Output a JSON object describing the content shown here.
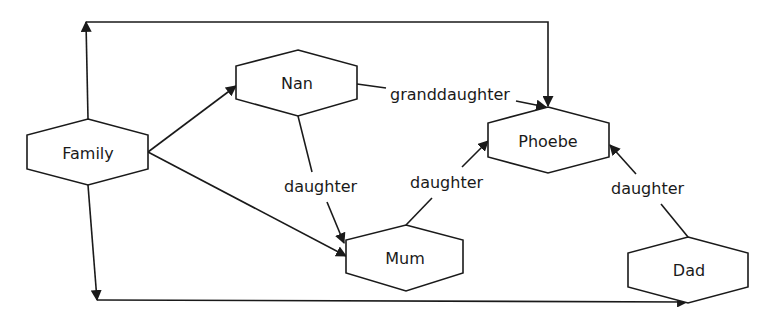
{
  "diagram": {
    "type": "relationship-graph",
    "colors": {
      "stroke": "#1a1a1a",
      "background": "#ffffff",
      "text": "#1a1a1a"
    },
    "nodes": [
      {
        "id": "family",
        "label": "Family",
        "shape": "hexagon"
      },
      {
        "id": "nan",
        "label": "Nan",
        "shape": "hexagon"
      },
      {
        "id": "phoebe",
        "label": "Phoebe",
        "shape": "hexagon"
      },
      {
        "id": "mum",
        "label": "Mum",
        "shape": "hexagon"
      },
      {
        "id": "dad",
        "label": "Dad",
        "shape": "hexagon"
      }
    ],
    "edges": [
      {
        "from": "family",
        "to": "nan",
        "label": ""
      },
      {
        "from": "family",
        "to": "mum",
        "label": ""
      },
      {
        "from": "family",
        "to": "phoebe",
        "label": "",
        "route": "top-loop"
      },
      {
        "from": "family",
        "to": "dad",
        "label": "",
        "route": "bottom-loop"
      },
      {
        "from": "nan",
        "to": "phoebe",
        "label": "granddaughter"
      },
      {
        "from": "nan",
        "to": "mum",
        "label": "daughter"
      },
      {
        "from": "mum",
        "to": "phoebe",
        "label": "daughter"
      },
      {
        "from": "dad",
        "to": "phoebe",
        "label": "daughter"
      }
    ]
  }
}
